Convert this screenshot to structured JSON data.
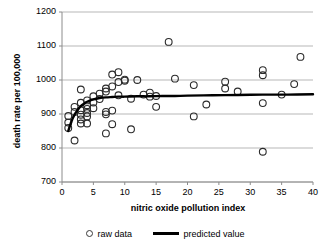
{
  "chart_data": {
    "type": "scatter",
    "title": "",
    "xlabel": "nitric oxide pollution index",
    "ylabel": "death rate per 100,000",
    "xlim": [
      0,
      40
    ],
    "ylim": [
      700,
      1200
    ],
    "xticks": [
      0,
      5,
      10,
      15,
      20,
      25,
      30,
      35,
      40
    ],
    "yticks": [
      700,
      800,
      900,
      1000,
      1100,
      1200
    ],
    "grid": "horizontal",
    "legend_position": "bottom",
    "series": [
      {
        "name": "raw data",
        "type": "scatter",
        "marker": "open-circle",
        "color": "#2b2b2b",
        "points": [
          [
            1,
            894
          ],
          [
            1,
            875
          ],
          [
            1,
            859
          ],
          [
            2,
            822
          ],
          [
            2,
            906
          ],
          [
            2,
            921
          ],
          [
            3,
            972
          ],
          [
            3,
            933
          ],
          [
            3,
            911
          ],
          [
            3,
            898
          ],
          [
            3,
            884
          ],
          [
            3,
            872
          ],
          [
            4,
            940
          ],
          [
            4,
            926
          ],
          [
            4,
            915
          ],
          [
            4,
            903
          ],
          [
            4,
            893
          ],
          [
            4,
            872
          ],
          [
            5,
            952
          ],
          [
            5,
            934
          ],
          [
            5,
            917
          ],
          [
            6,
            960
          ],
          [
            6,
            944
          ],
          [
            7,
            975
          ],
          [
            7,
            966
          ],
          [
            7,
            906
          ],
          [
            7,
            899
          ],
          [
            7,
            843
          ],
          [
            8,
            981
          ],
          [
            8,
            1016
          ],
          [
            8,
            910
          ],
          [
            8,
            870
          ],
          [
            9,
            1023
          ],
          [
            9,
            994
          ],
          [
            9,
            955
          ],
          [
            10,
            1001
          ],
          [
            10,
            998
          ],
          [
            11,
            945
          ],
          [
            11,
            855
          ],
          [
            12,
            1000
          ],
          [
            13,
            957
          ],
          [
            14,
            963
          ],
          [
            14,
            951
          ],
          [
            15,
            953
          ],
          [
            15,
            921
          ],
          [
            17,
            1112
          ],
          [
            18,
            1004
          ],
          [
            21,
            985
          ],
          [
            21,
            893
          ],
          [
            23,
            928
          ],
          [
            26,
            995
          ],
          [
            26,
            975
          ],
          [
            28,
            966
          ],
          [
            32,
            1029
          ],
          [
            32,
            1014
          ],
          [
            32,
            932
          ],
          [
            32,
            789
          ],
          [
            35,
            957
          ],
          [
            37,
            988
          ],
          [
            38,
            1068
          ]
        ]
      },
      {
        "name": "predicted value",
        "type": "line",
        "color": "#000000",
        "points": [
          [
            1,
            850
          ],
          [
            1.5,
            878
          ],
          [
            2,
            898
          ],
          [
            2.5,
            912
          ],
          [
            3,
            923
          ],
          [
            3.5,
            930
          ],
          [
            4,
            936
          ],
          [
            5,
            943
          ],
          [
            6,
            947
          ],
          [
            7,
            949
          ],
          [
            8,
            950
          ],
          [
            9,
            951
          ],
          [
            10,
            951
          ],
          [
            12,
            952
          ],
          [
            14,
            952
          ],
          [
            16,
            953
          ],
          [
            18,
            953
          ],
          [
            20,
            954
          ],
          [
            24,
            955
          ],
          [
            28,
            956
          ],
          [
            32,
            957
          ],
          [
            36,
            957
          ],
          [
            40,
            958
          ]
        ]
      }
    ]
  },
  "axis": {
    "x_title": "nitric oxide pollution index",
    "y_title": "death rate per 100,000",
    "x_tick_labels": [
      "0",
      "5",
      "10",
      "15",
      "20",
      "25",
      "30",
      "35",
      "40"
    ],
    "y_tick_labels": [
      "700",
      "800",
      "900",
      "1000",
      "1100",
      "1200"
    ]
  },
  "legend": {
    "items": [
      {
        "label": "raw data",
        "marker": "open-circle"
      },
      {
        "label": "predicted value",
        "marker": "line"
      }
    ]
  },
  "colors": {
    "marker_stroke": "#2b2b2b",
    "line": "#000000",
    "gridline": "#b7b7b7",
    "axis": "#8c8c8c",
    "text": "#000000",
    "background": "#ffffff"
  }
}
